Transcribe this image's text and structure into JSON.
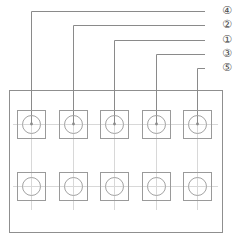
{
  "diagram": {
    "colors": {
      "line": "#8a8a8a",
      "panel_border": "#8f8f8f",
      "cell_border": "#9a9a9a",
      "circle_stroke": "#a3a3a3",
      "centerline": "#d8d8d8",
      "label_text": "#4a4a4a",
      "background": "#ffffff"
    },
    "panel": {
      "name": "component-tray-panel",
      "x": 9,
      "y": 90,
      "width": 213,
      "height": 142
    },
    "grid": {
      "rows": 2,
      "columns": 5,
      "cell_width": 28,
      "cell_height": 28,
      "circle_diameter": 18,
      "row_centers_y": [
        124,
        186
      ],
      "column_centers_x": [
        31,
        73,
        114,
        156,
        197
      ]
    },
    "cells": [
      {
        "id": "cell-r1c1",
        "row": 1,
        "column": 1,
        "cx": 31,
        "cy": 124,
        "callout": "4"
      },
      {
        "id": "cell-r1c2",
        "row": 1,
        "column": 2,
        "cx": 73,
        "cy": 124,
        "callout": "2"
      },
      {
        "id": "cell-r1c3",
        "row": 1,
        "column": 3,
        "cx": 114,
        "cy": 124,
        "callout": "1"
      },
      {
        "id": "cell-r1c4",
        "row": 1,
        "column": 4,
        "cx": 156,
        "cy": 124,
        "callout": "3"
      },
      {
        "id": "cell-r1c5",
        "row": 1,
        "column": 5,
        "cx": 197,
        "cy": 124,
        "callout": "5"
      },
      {
        "id": "cell-r2c1",
        "row": 2,
        "column": 1,
        "cx": 31,
        "cy": 186,
        "callout": null
      },
      {
        "id": "cell-r2c2",
        "row": 2,
        "column": 2,
        "cx": 73,
        "cy": 186,
        "callout": null
      },
      {
        "id": "cell-r2c3",
        "row": 2,
        "column": 3,
        "cx": 114,
        "cy": 186,
        "callout": null
      },
      {
        "id": "cell-r2c4",
        "row": 2,
        "column": 4,
        "cx": 156,
        "cy": 186,
        "callout": null
      },
      {
        "id": "cell-r2c5",
        "row": 2,
        "column": 5,
        "cx": 197,
        "cy": 186,
        "callout": null
      }
    ],
    "callouts": [
      {
        "id": "callout-4",
        "label": "④",
        "number": "4",
        "label_x": 222,
        "label_y": 11,
        "leader_y": 11,
        "leader_x_start": 205,
        "leader_corner_x": 31,
        "leader_end_y": 124
      },
      {
        "id": "callout-2",
        "label": "②",
        "number": "2",
        "label_x": 222,
        "label_y": 25,
        "leader_y": 25,
        "leader_x_start": 205,
        "leader_corner_x": 73,
        "leader_end_y": 124
      },
      {
        "id": "callout-1",
        "label": "①",
        "number": "1",
        "label_x": 222,
        "label_y": 40,
        "leader_y": 40,
        "leader_x_start": 205,
        "leader_corner_x": 114,
        "leader_end_y": 124
      },
      {
        "id": "callout-3",
        "label": "③",
        "number": "3",
        "label_x": 222,
        "label_y": 54,
        "leader_y": 54,
        "leader_x_start": 205,
        "leader_corner_x": 156,
        "leader_end_y": 124
      },
      {
        "id": "callout-5",
        "label": "⑤",
        "number": "5",
        "label_x": 222,
        "label_y": 68,
        "leader_y": 68,
        "leader_x_start": 205,
        "leader_corner_x": 197,
        "leader_end_y": 124
      }
    ]
  }
}
